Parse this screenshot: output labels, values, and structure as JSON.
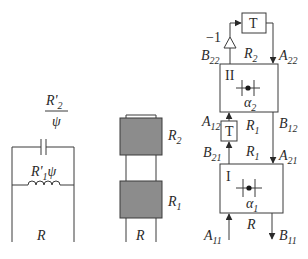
{
  "left_circuit": {
    "capacitor_label_numerator": "R'",
    "capacitor_label_numerator_sub": "2",
    "capacitor_label_denominator": "ψ",
    "inductor_label_main": "R'",
    "inductor_label_sub": "1",
    "inductor_label_suffix": "ψ",
    "bottom_label": "R"
  },
  "middle_stack": {
    "upper_block_label": "R",
    "upper_block_sub": "2",
    "lower_block_label": "R",
    "lower_block_sub": "1",
    "bottom_label": "R",
    "block_fill": "#8c8c8c"
  },
  "right_network": {
    "top_delay_label": "T",
    "inverter_gain": "−1",
    "mid_delay_label": "T",
    "block_II": {
      "label": "II",
      "param": "α",
      "param_sub": "2"
    },
    "block_I": {
      "label": "I",
      "param": "α",
      "param_sub": "1"
    },
    "signals": {
      "B22": {
        "main": "B",
        "sub": "22"
      },
      "A22": {
        "main": "A",
        "sub": "22"
      },
      "A12": {
        "main": "A",
        "sub": "12"
      },
      "B12": {
        "main": "B",
        "sub": "12"
      },
      "B21": {
        "main": "B",
        "sub": "21"
      },
      "A21": {
        "main": "A",
        "sub": "21"
      },
      "A11": {
        "main": "A",
        "sub": "11"
      },
      "B11": {
        "main": "B",
        "sub": "11"
      }
    },
    "region_labels": {
      "R2": {
        "main": "R",
        "sub": "2"
      },
      "R1_upper": {
        "main": "R",
        "sub": "1"
      },
      "R1_lower": {
        "main": "R",
        "sub": "1"
      },
      "R": {
        "main": "R"
      }
    }
  }
}
